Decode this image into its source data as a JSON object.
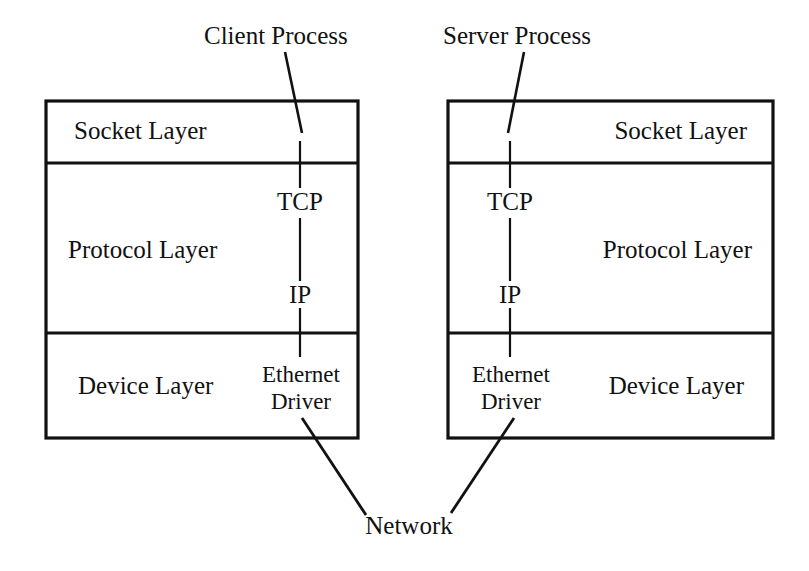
{
  "diagram": {
    "background_color": "#ffffff",
    "line_color": "#111111"
  },
  "annotations": {
    "client_process": "Client Process",
    "server_process": "Server Process",
    "network": "Network"
  },
  "client_stack": {
    "name": "Client Process Stack",
    "layers": [
      {
        "label": "Socket Layer"
      },
      {
        "label": "Protocol Layer"
      },
      {
        "label": "Device Layer"
      }
    ],
    "protocols": [
      {
        "label": "TCP"
      },
      {
        "label": "IP"
      }
    ],
    "driver": {
      "line1": "Ethernet",
      "line2": "Driver"
    }
  },
  "server_stack": {
    "name": "Server Process Stack",
    "layers": [
      {
        "label": "Socket Layer"
      },
      {
        "label": "Protocol Layer"
      },
      {
        "label": "Device Layer"
      }
    ],
    "protocols": [
      {
        "label": "TCP"
      },
      {
        "label": "IP"
      }
    ],
    "driver": {
      "line1": "Ethernet",
      "line2": "Driver"
    }
  }
}
